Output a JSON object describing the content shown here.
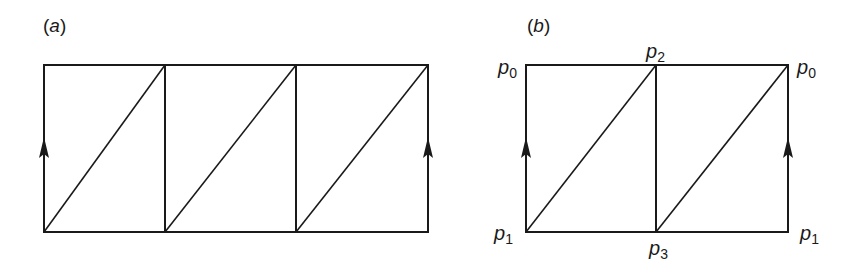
{
  "figure": {
    "panels": [
      {
        "id": "a",
        "label_open": "(",
        "label_letter": "a",
        "label_close": ")",
        "description": "Strip of three squares, each divided by a diagonal from bottom-left to top-right; left and right edges marked with upward arrows (identified)",
        "squares": 3,
        "vertex_labels": []
      },
      {
        "id": "b",
        "label_open": "(",
        "label_letter": "b",
        "label_close": ")",
        "description": "Strip of two squares, each divided by a diagonal; left and right edges marked with upward arrows (identified)",
        "squares": 2,
        "vertex_labels": [
          {
            "name": "top-left",
            "base": "p",
            "sub": "0"
          },
          {
            "name": "top-middle",
            "base": "p",
            "sub": "2"
          },
          {
            "name": "top-right",
            "base": "p",
            "sub": "0"
          },
          {
            "name": "bottom-left",
            "base": "p",
            "sub": "1"
          },
          {
            "name": "bottom-middle",
            "base": "p",
            "sub": "3"
          },
          {
            "name": "bottom-right",
            "base": "p",
            "sub": "1"
          }
        ]
      }
    ],
    "colors": {
      "line": "#1a1a1a",
      "background": "#ffffff"
    }
  }
}
